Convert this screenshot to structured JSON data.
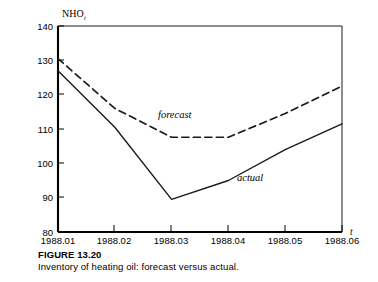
{
  "figure": {
    "caption_title": "FIGURE 13.20",
    "caption_text": "Inventory of heating oil: forecast versus actual."
  },
  "chart_data": {
    "type": "line",
    "title": "",
    "ylabel": "NHO",
    "ylabel_subscript": "t",
    "xlabel": "t",
    "x": [
      "1988.01",
      "1988.02",
      "1988.03",
      "1988.04",
      "1988.05",
      "1988.06"
    ],
    "categories": [
      "1988.01",
      "1988.02",
      "1988.03",
      "1988.04",
      "1988.05",
      "1988.06"
    ],
    "yticks": [
      80,
      90,
      100,
      110,
      120,
      130,
      140
    ],
    "ytick_labels": [
      "80",
      "90",
      "100",
      "110",
      "120",
      "130",
      "140"
    ],
    "ylim": [
      80,
      140
    ],
    "xlim": [
      "1988.01",
      "1988.06"
    ],
    "grid": false,
    "legend_position": "inline-annotation",
    "series": [
      {
        "name": "forecast",
        "label": "forecast",
        "style": "dashed",
        "color": "#1a1a1a",
        "values": [
          130.5,
          116.0,
          107.6,
          107.6,
          114.5,
          122.5
        ]
      },
      {
        "name": "actual",
        "label": "actual",
        "style": "solid",
        "color": "#1a1a1a",
        "values": [
          127.0,
          110.5,
          89.5,
          95.0,
          104.0,
          111.5
        ]
      }
    ],
    "annotations": [
      {
        "text": "forecast",
        "x": "1988.02-03",
        "y": 116
      },
      {
        "text": "actual",
        "x": "1988.04",
        "y": 98
      }
    ]
  }
}
